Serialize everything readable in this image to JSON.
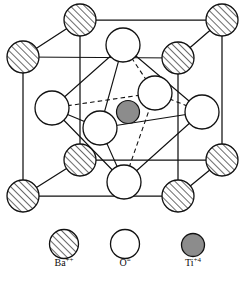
{
  "figure": {
    "type": "crystal-structure-diagram",
    "background_color": "#ffffff",
    "line_color": "#111111"
  },
  "legend": {
    "items": [
      {
        "key": "ba",
        "symbol": "Ba",
        "charge": "++",
        "label": "Ba++",
        "swatch_style": "hatched-circle",
        "fill": "#ffffff",
        "hatch_color": "#2b2b2b",
        "stroke": "#111111",
        "cx": 64,
        "cy": 244,
        "r": 14.5,
        "label_x": 64,
        "label_y": 264
      },
      {
        "key": "o",
        "symbol": "O",
        "charge": "=",
        "label": "O=",
        "swatch_style": "open-circle",
        "fill": "#ffffff",
        "stroke": "#111111",
        "cx": 125,
        "cy": 244,
        "r": 14.5,
        "label_x": 125,
        "label_y": 264
      },
      {
        "key": "ti",
        "symbol": "Ti",
        "charge": "+4",
        "label": "Ti+4",
        "swatch_style": "filled-circle",
        "fill": "#8c8c8c",
        "stroke": "#111111",
        "cx": 193,
        "cy": 245,
        "r": 11.5,
        "label_x": 193,
        "label_y": 264
      }
    ]
  },
  "cell": {
    "vertices": {
      "back_top_left": {
        "x": 80,
        "y": 20
      },
      "back_top_right": {
        "x": 222,
        "y": 20
      },
      "front_top_left": {
        "x": 23,
        "y": 57
      },
      "front_top_right": {
        "x": 178,
        "y": 58
      },
      "back_bottom_left": {
        "x": 80,
        "y": 160
      },
      "back_bottom_right": {
        "x": 222,
        "y": 160
      },
      "front_bottom_left": {
        "x": 23,
        "y": 196
      },
      "front_bottom_right": {
        "x": 178,
        "y": 196
      }
    },
    "edges": [
      [
        "back_top_left",
        "back_top_right"
      ],
      [
        "back_top_left",
        "front_top_left"
      ],
      [
        "back_top_right",
        "front_top_right"
      ],
      [
        "front_top_left",
        "front_top_right"
      ],
      [
        "back_bottom_left",
        "back_bottom_right"
      ],
      [
        "back_bottom_left",
        "front_bottom_left"
      ],
      [
        "back_bottom_right",
        "front_bottom_right"
      ],
      [
        "front_bottom_left",
        "front_bottom_right"
      ],
      [
        "back_top_left",
        "back_bottom_left"
      ],
      [
        "back_top_right",
        "back_bottom_right"
      ],
      [
        "front_top_left",
        "front_bottom_left"
      ],
      [
        "front_top_right",
        "front_bottom_right"
      ]
    ]
  },
  "atoms": {
    "barium": {
      "species": "Ba",
      "site": "corner",
      "count": 8,
      "r": 16,
      "fill": "#ffffff",
      "stroke": "#111111",
      "positions": [
        {
          "name": "corner-back-top-left",
          "x": 80,
          "y": 20
        },
        {
          "name": "corner-back-top-right",
          "x": 222,
          "y": 20
        },
        {
          "name": "corner-front-top-left",
          "x": 23,
          "y": 57
        },
        {
          "name": "corner-front-top-right",
          "x": 178,
          "y": 58
        },
        {
          "name": "corner-back-bottom-left",
          "x": 80,
          "y": 160
        },
        {
          "name": "corner-back-bottom-right",
          "x": 222,
          "y": 160
        },
        {
          "name": "corner-front-bottom-left",
          "x": 23,
          "y": 196
        },
        {
          "name": "corner-front-bottom-right",
          "x": 178,
          "y": 196
        }
      ]
    },
    "oxygen": {
      "species": "O",
      "site": "face-center",
      "count": 6,
      "r": 17,
      "fill": "#ffffff",
      "stroke": "#111111",
      "positions": [
        {
          "name": "face-top",
          "x": 123,
          "y": 45
        },
        {
          "name": "face-bottom",
          "x": 124,
          "y": 182
        },
        {
          "name": "face-left",
          "x": 52,
          "y": 108
        },
        {
          "name": "face-right",
          "x": 202,
          "y": 112
        },
        {
          "name": "face-back",
          "x": 155,
          "y": 93
        },
        {
          "name": "face-front",
          "x": 100,
          "y": 128
        }
      ]
    },
    "titanium": {
      "species": "Ti",
      "site": "body-center",
      "count": 1,
      "r": 11.5,
      "fill": "#8c8c8c",
      "stroke": "#111111",
      "positions": [
        {
          "name": "body-center",
          "x": 128,
          "y": 112
        }
      ]
    }
  },
  "octahedron": {
    "description": "oxygen octahedron around central Ti",
    "solid_edges": [
      [
        "face-top",
        "face-left"
      ],
      [
        "face-top",
        "face-front"
      ],
      [
        "face-bottom",
        "face-left"
      ],
      [
        "face-bottom",
        "face-front"
      ],
      [
        "face-left",
        "face-front"
      ],
      [
        "face-top",
        "face-right"
      ],
      [
        "face-bottom",
        "face-right"
      ],
      [
        "face-right",
        "face-front"
      ]
    ],
    "dashed_edges": [
      [
        "face-top",
        "face-back"
      ],
      [
        "face-bottom",
        "face-back"
      ],
      [
        "face-left",
        "face-back"
      ],
      [
        "face-right",
        "face-back"
      ]
    ]
  }
}
